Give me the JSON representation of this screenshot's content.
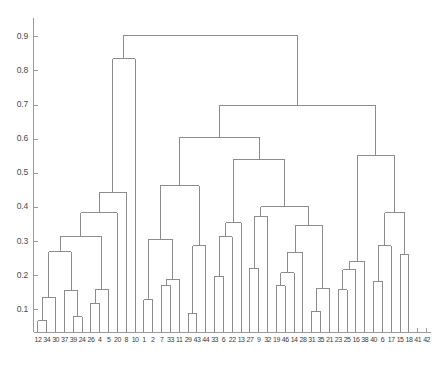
{
  "figure": {
    "type": "dendrogram",
    "background_color": "#ffffff",
    "line_color": "#8c8c8c",
    "axis_color": "#9a9a9a",
    "label_color": "#4a4a4a"
  },
  "axes": {
    "y_ticks": [
      "0.9",
      "0.8",
      "0.7",
      "0.6",
      "0.5",
      "0.4",
      "0.3",
      "0.2",
      "0.1"
    ],
    "y_tick_values": [
      0.9,
      0.8,
      0.7,
      0.6,
      0.5,
      0.4,
      0.3,
      0.2,
      0.1
    ],
    "ylim": [
      0.035,
      0.955
    ],
    "xlim": [
      0.5,
      45.5
    ],
    "grid": false,
    "xlabel": "",
    "ylabel": ""
  },
  "chart_data": {
    "type": "line",
    "title": "",
    "xlabel": "",
    "ylabel": "",
    "ylim": [
      0.035,
      0.955
    ],
    "grid": false,
    "legend": "none",
    "leaf_count": 45,
    "leaf_labels": [
      "1",
      "23",
      "43",
      "30",
      "37",
      "39",
      "24",
      "26",
      "4",
      "5",
      "20",
      "8",
      "10",
      "1",
      "2",
      "7",
      "33",
      "11",
      "29",
      "43",
      "44",
      "33",
      "6",
      "22",
      "13",
      "27",
      "9",
      "32",
      "19",
      "46",
      "14",
      "29",
      "3",
      "13",
      "5",
      "21",
      "23",
      "25",
      "16",
      "38",
      "40",
      "6",
      "17",
      "15",
      "18",
      "41",
      "42",
      "45"
    ],
    "leaf_order": [
      "12",
      "34",
      "30",
      "37",
      "39",
      "24",
      "26",
      "4",
      "5",
      "20",
      "8",
      "10",
      "1",
      "2",
      "7",
      "33",
      "11",
      "29",
      "43",
      "44",
      "33",
      "6",
      "22",
      "13",
      "27",
      "9",
      "32",
      "19",
      "46",
      "14",
      "28",
      "3",
      "13",
      "5",
      "21",
      "23",
      "25",
      "16",
      "38",
      "40",
      "6",
      "17",
      "15",
      "18",
      "41",
      "42",
      "45"
    ],
    "tick_labels_rendered": [
      "12",
      "3",
      "43",
      "30",
      "37",
      "39",
      "24",
      "26",
      "4",
      "5",
      "20",
      "8",
      "10",
      "1",
      "2",
      "7",
      "33",
      "11",
      "29",
      "43",
      "44",
      "33",
      "6",
      "22",
      "13",
      "27",
      "9",
      "32",
      "19",
      "46",
      "14",
      "28",
      "3",
      "13",
      "5",
      "21",
      "23",
      "25",
      "16",
      "38",
      "40",
      "6",
      "17",
      "15",
      "18",
      "41",
      "42",
      "45"
    ],
    "xticklabels": [
      "12",
      "34",
      "30",
      "37",
      "39",
      "24",
      "26",
      "4",
      "5",
      "20",
      "8",
      "10",
      "1",
      "2",
      "7",
      "33",
      "11",
      "29",
      "43",
      "44",
      "33",
      "6",
      "22",
      "13",
      "27",
      "9",
      "32",
      "19",
      "46",
      "14",
      "28",
      "31",
      "35",
      "21",
      "23",
      "25",
      "16",
      "38",
      "40",
      "6",
      "17",
      "15",
      "18",
      "41",
      "42"
    ],
    "ylabel_values": [
      0.9,
      0.8,
      0.7,
      0.6,
      0.5,
      0.4,
      0.3,
      0.2,
      0.1
    ],
    "merges": [
      {
        "id": "n1",
        "left": {
          "leaf": 1
        },
        "right": {
          "leaf": 2
        },
        "height": 0.068
      },
      {
        "id": "n2",
        "left": {
          "node": "n1"
        },
        "right": {
          "leaf": 3
        },
        "height": 0.137
      },
      {
        "id": "n3",
        "left": {
          "leaf": 5
        },
        "right": {
          "leaf": 6
        },
        "height": 0.079
      },
      {
        "id": "n4",
        "left": {
          "leaf": 4
        },
        "right": {
          "node": "n3"
        },
        "height": 0.157
      },
      {
        "id": "n5",
        "left": {
          "node": "n2"
        },
        "right": {
          "node": "n4"
        },
        "height": 0.27
      },
      {
        "id": "n6",
        "left": {
          "leaf": 7
        },
        "right": {
          "leaf": 8
        },
        "height": 0.119
      },
      {
        "id": "n7",
        "left": {
          "node": "n6"
        },
        "right": {
          "leaf": 9
        },
        "height": 0.16
      },
      {
        "id": "n8",
        "left": {
          "node": "n5"
        },
        "right": {
          "node": "n7"
        },
        "height": 0.316
      },
      {
        "id": "n9",
        "left": {
          "node": "n8"
        },
        "right": {
          "leaf": 10
        },
        "height": 0.385
      },
      {
        "id": "n10",
        "left": {
          "node": "n9"
        },
        "right": {
          "leaf": 11
        },
        "height": 0.444
      },
      {
        "id": "n11",
        "left": {
          "node": "n10"
        },
        "right": {
          "leaf": 12
        },
        "height": 0.835
      },
      {
        "id": "n12",
        "left": {
          "leaf": 13
        },
        "right": {
          "leaf": 14
        },
        "height": 0.13
      },
      {
        "id": "n13",
        "left": {
          "leaf": 15
        },
        "right": {
          "leaf": 16
        },
        "height": 0.172
      },
      {
        "id": "n14",
        "left": {
          "node": "n13"
        },
        "right": {
          "leaf": 17
        },
        "height": 0.19
      },
      {
        "id": "n15",
        "left": {
          "node": "n12"
        },
        "right": {
          "node": "n14"
        },
        "height": 0.306
      },
      {
        "id": "n16",
        "left": {
          "leaf": 18
        },
        "right": {
          "leaf": 19
        },
        "height": 0.089
      },
      {
        "id": "n17",
        "left": {
          "node": "n16"
        },
        "right": {
          "leaf": 20
        },
        "height": 0.288
      },
      {
        "id": "n18",
        "left": {
          "node": "n15"
        },
        "right": {
          "node": "n17"
        },
        "height": 0.464
      },
      {
        "id": "n19",
        "left": {
          "leaf": 21
        },
        "right": {
          "leaf": 22
        },
        "height": 0.198
      },
      {
        "id": "n20",
        "left": {
          "node": "n19"
        },
        "right": {
          "leaf": 23
        },
        "height": 0.314
      },
      {
        "id": "n21",
        "left": {
          "node": "n20"
        },
        "right": {
          "leaf": 24
        },
        "height": 0.355
      },
      {
        "id": "n22",
        "left": {
          "leaf": 25
        },
        "right": {
          "leaf": 26
        },
        "height": 0.222
      },
      {
        "id": "n23",
        "left": {
          "node": "n22"
        },
        "right": {
          "leaf": 27
        },
        "height": 0.374
      },
      {
        "id": "n24",
        "left": {
          "leaf": 28
        },
        "right": {
          "leaf": 29
        },
        "height": 0.17
      },
      {
        "id": "n25",
        "left": {
          "node": "n24"
        },
        "right": {
          "leaf": 30
        },
        "height": 0.208
      },
      {
        "id": "n26",
        "left": {
          "node": "n25"
        },
        "right": {
          "leaf": 31
        },
        "height": 0.268
      },
      {
        "id": "n27",
        "left": {
          "leaf": 32
        },
        "right": {
          "leaf": 33
        },
        "height": 0.096
      },
      {
        "id": "n28",
        "left": {
          "node": "n27"
        },
        "right": {
          "leaf": 34
        },
        "height": 0.163
      },
      {
        "id": "n29",
        "left": {
          "node": "n26"
        },
        "right": {
          "node": "n28"
        },
        "height": 0.346
      },
      {
        "id": "n30",
        "left": {
          "node": "n23"
        },
        "right": {
          "node": "n29"
        },
        "height": 0.402
      },
      {
        "id": "n31",
        "left": {
          "node": "n21"
        },
        "right": {
          "node": "n30"
        },
        "height": 0.54
      },
      {
        "id": "n32",
        "left": {
          "node": "n18"
        },
        "right": {
          "node": "n31"
        },
        "height": 0.606
      },
      {
        "id": "n33",
        "left": {
          "leaf": 35
        },
        "right": {
          "leaf": 36
        },
        "height": 0.159
      },
      {
        "id": "n34",
        "left": {
          "node": "n33"
        },
        "right": {
          "leaf": 37
        },
        "height": 0.217
      },
      {
        "id": "n35",
        "left": {
          "node": "n34"
        },
        "right": {
          "leaf": 38
        },
        "height": 0.242
      },
      {
        "id": "n36",
        "left": {
          "leaf": 39
        },
        "right": {
          "leaf": 40
        },
        "height": 0.184
      },
      {
        "id": "n37",
        "left": {
          "node": "n36"
        },
        "right": {
          "leaf": 41
        },
        "height": 0.287
      },
      {
        "id": "n38",
        "left": {
          "leaf": 42
        },
        "right": {
          "leaf": 43
        },
        "height": 0.263
      },
      {
        "id": "n39",
        "left": {
          "node": "n37"
        },
        "right": {
          "node": "n38"
        },
        "height": 0.385
      },
      {
        "id": "n40",
        "left": {
          "node": "n35"
        },
        "right": {
          "node": "n39"
        },
        "height": 0.553
      },
      {
        "id": "n41",
        "left": {
          "node": "n32"
        },
        "right": {
          "node": "n40"
        },
        "height": 0.7
      },
      {
        "id": "n42",
        "left": {
          "node": "n11"
        },
        "right": {
          "node": "n41"
        },
        "height": 0.905
      }
    ]
  }
}
